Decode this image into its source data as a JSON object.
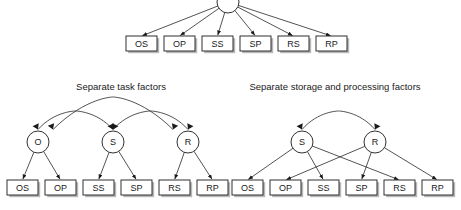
{
  "figure": {
    "width": 461,
    "height": 210,
    "background": "#ffffff",
    "line_color": "#1a1a1a",
    "shadow_color": "#b8b8b8"
  },
  "panels": {
    "top": {
      "title": "",
      "latent_nodes": [
        {
          "id": "g",
          "label": "",
          "shape": "circle",
          "cx": 228,
          "cy": 2,
          "r": 11
        }
      ],
      "observed_nodes": [
        {
          "id": "OS",
          "label": "OS",
          "x": 126,
          "y": 36,
          "w": 31,
          "h": 15
        },
        {
          "id": "OP",
          "label": "OP",
          "x": 164,
          "y": 36,
          "w": 31,
          "h": 15
        },
        {
          "id": "SS",
          "label": "SS",
          "x": 202,
          "y": 36,
          "w": 31,
          "h": 15
        },
        {
          "id": "SP",
          "label": "SP",
          "x": 240,
          "y": 36,
          "w": 31,
          "h": 15
        },
        {
          "id": "RS",
          "label": "RS",
          "x": 278,
          "y": 36,
          "w": 31,
          "h": 15
        },
        {
          "id": "RP",
          "label": "RP",
          "x": 316,
          "y": 36,
          "w": 31,
          "h": 15
        }
      ],
      "loadings": [
        {
          "from": "g",
          "to": "OS"
        },
        {
          "from": "g",
          "to": "OP"
        },
        {
          "from": "g",
          "to": "SS"
        },
        {
          "from": "g",
          "to": "SP"
        },
        {
          "from": "g",
          "to": "RS"
        },
        {
          "from": "g",
          "to": "RP"
        }
      ],
      "correlations": []
    },
    "bottom_left": {
      "title": "Separate task factors",
      "title_x": 121,
      "title_y": 87,
      "latent_nodes": [
        {
          "id": "O",
          "label": "O",
          "shape": "circle",
          "cx": 38,
          "cy": 142,
          "r": 11
        },
        {
          "id": "S",
          "label": "S",
          "shape": "circle",
          "cx": 113,
          "cy": 142,
          "r": 11
        },
        {
          "id": "R",
          "label": "R",
          "shape": "circle",
          "cx": 188,
          "cy": 142,
          "r": 11
        }
      ],
      "observed_nodes": [
        {
          "id": "OS",
          "label": "OS",
          "x": 7,
          "y": 180,
          "w": 31,
          "h": 15
        },
        {
          "id": "OP",
          "label": "OP",
          "x": 45,
          "y": 180,
          "w": 31,
          "h": 15
        },
        {
          "id": "SS",
          "label": "SS",
          "x": 83,
          "y": 180,
          "w": 31,
          "h": 15
        },
        {
          "id": "SP",
          "label": "SP",
          "x": 121,
          "y": 180,
          "w": 31,
          "h": 15
        },
        {
          "id": "RS",
          "label": "RS",
          "x": 159,
          "y": 180,
          "w": 31,
          "h": 15
        },
        {
          "id": "RP",
          "label": "RP",
          "x": 197,
          "y": 180,
          "w": 31,
          "h": 15
        }
      ],
      "loadings": [
        {
          "from": "O",
          "to": "OS"
        },
        {
          "from": "O",
          "to": "OP"
        },
        {
          "from": "S",
          "to": "SS"
        },
        {
          "from": "S",
          "to": "SP"
        },
        {
          "from": "R",
          "to": "RS"
        },
        {
          "from": "R",
          "to": "RP"
        }
      ],
      "correlations": [
        {
          "from": "O",
          "to": "S",
          "arc": "small"
        },
        {
          "from": "S",
          "to": "R",
          "arc": "small"
        },
        {
          "from": "O",
          "to": "R",
          "arc": "large"
        }
      ]
    },
    "bottom_right": {
      "title": "Separate storage and processing factors",
      "title_x": 335,
      "title_y": 87,
      "latent_nodes": [
        {
          "id": "S",
          "label": "S",
          "shape": "circle",
          "cx": 302,
          "cy": 142,
          "r": 11
        },
        {
          "id": "R",
          "label": "R",
          "shape": "circle",
          "cx": 375,
          "cy": 142,
          "r": 11
        }
      ],
      "observed_nodes": [
        {
          "id": "OS",
          "label": "OS",
          "x": 232,
          "y": 180,
          "w": 31,
          "h": 15
        },
        {
          "id": "OP",
          "label": "OP",
          "x": 270,
          "y": 180,
          "w": 31,
          "h": 15
        },
        {
          "id": "SS",
          "label": "SS",
          "x": 308,
          "y": 180,
          "w": 31,
          "h": 15
        },
        {
          "id": "SP",
          "label": "SP",
          "x": 346,
          "y": 180,
          "w": 31,
          "h": 15
        },
        {
          "id": "RS",
          "label": "RS",
          "x": 384,
          "y": 180,
          "w": 31,
          "h": 15
        },
        {
          "id": "RP",
          "label": "RP",
          "x": 422,
          "y": 180,
          "w": 31,
          "h": 15
        }
      ],
      "loadings": [
        {
          "from": "S",
          "to": "OS"
        },
        {
          "from": "S",
          "to": "SS"
        },
        {
          "from": "S",
          "to": "RS"
        },
        {
          "from": "R",
          "to": "OP"
        },
        {
          "from": "R",
          "to": "SP"
        },
        {
          "from": "R",
          "to": "RP"
        }
      ],
      "correlations": [
        {
          "from": "S",
          "to": "R",
          "arc": "small"
        }
      ]
    }
  }
}
